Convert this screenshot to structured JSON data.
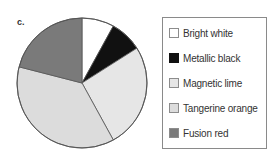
{
  "panel_label": "c.",
  "chart_data": {
    "type": "pie",
    "title": "",
    "start_angle_deg": 0,
    "direction": "clockwise",
    "categories": [
      "Bright white",
      "Metallic black",
      "Magnetic lime",
      "Tangerine orange",
      "Fusion red"
    ],
    "values": [
      8,
      8,
      26,
      37,
      21
    ],
    "colors": [
      "#ffffff",
      "#111111",
      "#e6e6e6",
      "#dcdcdc",
      "#7a7a7a"
    ],
    "legend_position": "right",
    "legend": [
      {
        "label": "Bright white",
        "color": "#ffffff"
      },
      {
        "label": "Metallic black",
        "color": "#111111"
      },
      {
        "label": "Magnetic lime",
        "color": "#e6e6e6"
      },
      {
        "label": "Tangerine orange",
        "color": "#dcdcdc"
      },
      {
        "label": "Fusion red",
        "color": "#7a7a7a"
      }
    ]
  },
  "legend": {
    "items": [
      {
        "label": "Bright white"
      },
      {
        "label": "Metallic black"
      },
      {
        "label": "Magnetic lime"
      },
      {
        "label": "Tangerine orange"
      },
      {
        "label": "Fusion red"
      }
    ]
  }
}
